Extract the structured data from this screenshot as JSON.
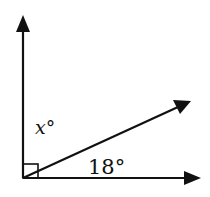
{
  "diagram": {
    "type": "angle-diagram",
    "labels": {
      "x_angle": "x°",
      "given_angle": "18°"
    },
    "angle_between_axes_deg": 90,
    "given_angle_deg": 18,
    "right_angle_marker": true,
    "rays": [
      "vertical-up",
      "diagonal",
      "horizontal-right"
    ],
    "colors": {
      "stroke": "#111111",
      "background": "#ffffff"
    }
  }
}
